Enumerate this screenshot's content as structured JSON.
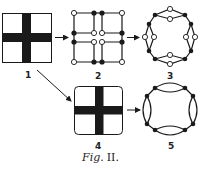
{
  "figure": {
    "caption_prefix": "Fig.",
    "caption_number": "II.",
    "colors": {
      "ink": "#1a1a1a",
      "background": "#ffffff"
    },
    "panels": [
      {
        "id": "1",
        "label": "1",
        "type": "square-with-cross",
        "corners": "sharp"
      },
      {
        "id": "2",
        "label": "2",
        "type": "grid-graph",
        "open_nodes": 8,
        "filled_nodes": 8
      },
      {
        "id": "3",
        "label": "3",
        "type": "ring-graph",
        "open_nodes": 8,
        "filled_nodes": 8
      },
      {
        "id": "4",
        "label": "4",
        "type": "square-with-cross",
        "corners": "rounded"
      },
      {
        "id": "5",
        "label": "5",
        "type": "ring-graph",
        "open_nodes": 0,
        "filled_nodes": 8
      }
    ],
    "arrows": [
      {
        "from": "1",
        "to": "2"
      },
      {
        "from": "2",
        "to": "3"
      },
      {
        "from": "1",
        "to": "4"
      },
      {
        "from": "4",
        "to": "5"
      }
    ]
  }
}
